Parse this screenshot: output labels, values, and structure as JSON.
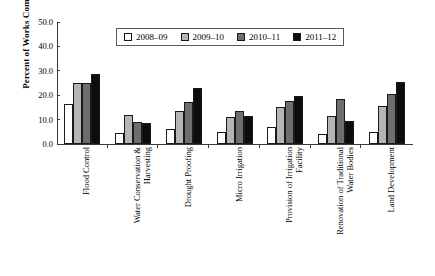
{
  "top_caption": "partially cropped header text",
  "chart_data": {
    "type": "bar",
    "title": "",
    "xlabel": "",
    "ylabel": "Percent of Works Completed",
    "ylim": [
      0,
      50
    ],
    "yticks": [
      "0.0",
      "10.0",
      "20.0",
      "30.0",
      "40.0",
      "50.0"
    ],
    "ytick_values": [
      0,
      10,
      20,
      30,
      40,
      50
    ],
    "grid": false,
    "legend_position": "top-center",
    "categories": [
      "Flood Control",
      "Water Conservation & Harvesting",
      "Drought Proofing",
      "Micro Irrigation",
      "Provision of Irrigation Facility",
      "Renovation of Traditional Water Bodies",
      "Land Development"
    ],
    "category_lines": [
      [
        "Flood Control"
      ],
      [
        "Water Conservation &",
        "Harvesting"
      ],
      [
        "Drought Proofing"
      ],
      [
        "Micro Irrigation"
      ],
      [
        "Provision of Irrigation",
        "Facility"
      ],
      [
        "Renovation of Traditional",
        "Water Bodies"
      ],
      [
        "Land Development"
      ]
    ],
    "series": [
      {
        "name": "2008–09",
        "color": "#ffffff",
        "values": [
          16.5,
          4.5,
          6.0,
          5.0,
          7.0,
          4.0,
          5.0
        ]
      },
      {
        "name": "2009–10",
        "color": "#b5b5b5",
        "values": [
          25.2,
          12.0,
          13.5,
          11.0,
          15.0,
          11.5,
          15.5
        ]
      },
      {
        "name": "2010–11",
        "color": "#6e6e6e",
        "values": [
          25.2,
          9.0,
          17.3,
          13.5,
          17.5,
          18.5,
          20.5
        ]
      },
      {
        "name": "2011–12",
        "color": "#0d0d0d",
        "values": [
          28.7,
          8.7,
          23.0,
          11.5,
          19.5,
          9.5,
          25.5
        ]
      }
    ]
  }
}
